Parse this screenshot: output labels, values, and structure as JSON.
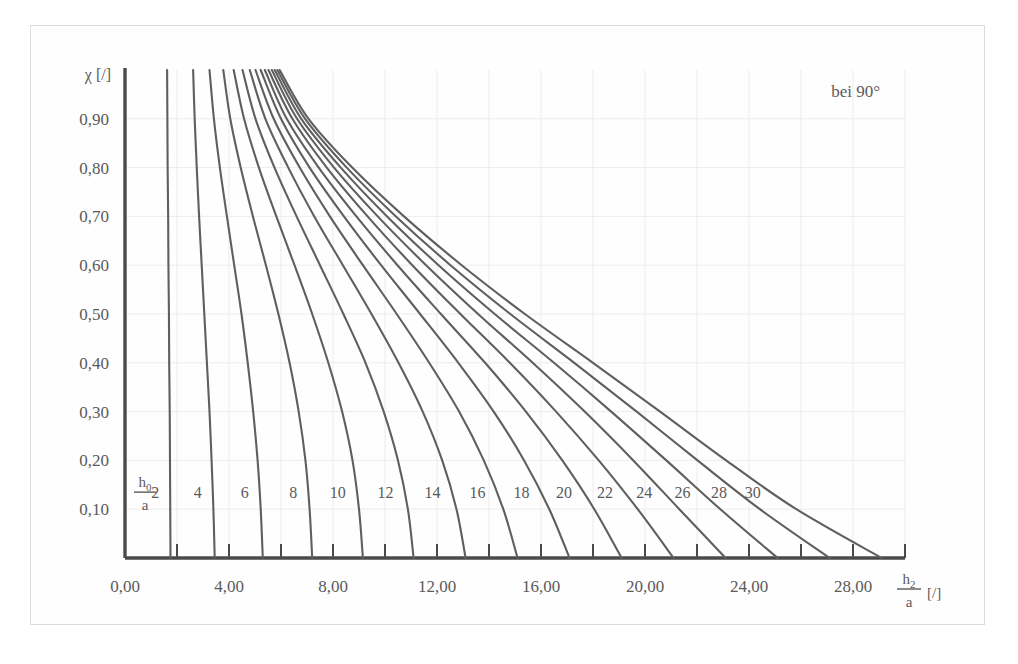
{
  "chart_data": {
    "type": "line",
    "title": "",
    "annotation": "bei 90°",
    "xlabel_main": "h",
    "xlabel_sub": "2",
    "xlabel_den": "a",
    "xlabel_unit": "[/]",
    "ylabel": "χ [/]",
    "curve_family_label_num": "h",
    "curve_family_label_sub": "0",
    "curve_family_label_den": "a",
    "xlim": [
      0,
      30
    ],
    "ylim": [
      0,
      1.0
    ],
    "grid": true,
    "x_tick_labels": [
      "0,00",
      "4,00",
      "8,00",
      "12,00",
      "16,00",
      "20,00",
      "24,00",
      "28,00"
    ],
    "x_tick_values": [
      0,
      4,
      8,
      12,
      16,
      20,
      24,
      28
    ],
    "x_minor_tick_values": [
      2,
      6,
      10,
      14,
      18,
      22,
      26,
      30
    ],
    "y_tick_labels": [
      "0,10",
      "0,20",
      "0,30",
      "0,40",
      "0,50",
      "0,60",
      "0,70",
      "0,80",
      "0,90"
    ],
    "y_tick_values": [
      0.1,
      0.2,
      0.3,
      0.4,
      0.5,
      0.6,
      0.7,
      0.8,
      0.9
    ],
    "series": [
      {
        "name": "2",
        "label": "2",
        "x_intercept": 1.75,
        "points": [
          [
            1.62,
            1.0
          ],
          [
            1.63,
            0.9
          ],
          [
            1.64,
            0.8
          ],
          [
            1.66,
            0.7
          ],
          [
            1.67,
            0.6
          ],
          [
            1.69,
            0.5
          ],
          [
            1.7,
            0.4
          ],
          [
            1.72,
            0.3
          ],
          [
            1.73,
            0.2
          ],
          [
            1.74,
            0.1
          ],
          [
            1.75,
            0.0
          ]
        ]
      },
      {
        "name": "4",
        "label": "4",
        "x_intercept": 3.45,
        "points": [
          [
            2.62,
            1.0
          ],
          [
            2.68,
            0.9
          ],
          [
            2.76,
            0.8
          ],
          [
            2.85,
            0.7
          ],
          [
            2.95,
            0.6
          ],
          [
            3.05,
            0.5
          ],
          [
            3.15,
            0.4
          ],
          [
            3.25,
            0.3
          ],
          [
            3.33,
            0.2
          ],
          [
            3.4,
            0.1
          ],
          [
            3.45,
            0.0
          ]
        ]
      },
      {
        "name": "6",
        "label": "6",
        "x_intercept": 5.3,
        "points": [
          [
            3.25,
            1.0
          ],
          [
            3.42,
            0.9
          ],
          [
            3.65,
            0.8
          ],
          [
            3.92,
            0.7
          ],
          [
            4.2,
            0.6
          ],
          [
            4.48,
            0.5
          ],
          [
            4.72,
            0.4
          ],
          [
            4.93,
            0.3
          ],
          [
            5.1,
            0.2
          ],
          [
            5.22,
            0.1
          ],
          [
            5.3,
            0.0
          ]
        ]
      },
      {
        "name": "8",
        "label": "8",
        "x_intercept": 7.2,
        "points": [
          [
            3.78,
            1.0
          ],
          [
            4.05,
            0.9
          ],
          [
            4.45,
            0.8
          ],
          [
            4.92,
            0.7
          ],
          [
            5.42,
            0.6
          ],
          [
            5.9,
            0.5
          ],
          [
            6.33,
            0.4
          ],
          [
            6.68,
            0.3
          ],
          [
            6.94,
            0.2
          ],
          [
            7.1,
            0.1
          ],
          [
            7.2,
            0.0
          ]
        ]
      },
      {
        "name": "10",
        "label": "10",
        "x_intercept": 9.15,
        "points": [
          [
            4.18,
            1.0
          ],
          [
            4.58,
            0.9
          ],
          [
            5.15,
            0.8
          ],
          [
            5.82,
            0.7
          ],
          [
            6.52,
            0.6
          ],
          [
            7.2,
            0.5
          ],
          [
            7.82,
            0.4
          ],
          [
            8.35,
            0.3
          ],
          [
            8.75,
            0.2
          ],
          [
            9.0,
            0.1
          ],
          [
            9.15,
            0.0
          ]
        ]
      },
      {
        "name": "12",
        "label": "12",
        "x_intercept": 11.1,
        "points": [
          [
            4.52,
            1.0
          ],
          [
            5.02,
            0.9
          ],
          [
            5.75,
            0.8
          ],
          [
            6.6,
            0.7
          ],
          [
            7.5,
            0.6
          ],
          [
            8.4,
            0.5
          ],
          [
            9.25,
            0.4
          ],
          [
            9.95,
            0.3
          ],
          [
            10.5,
            0.2
          ],
          [
            10.88,
            0.1
          ],
          [
            11.1,
            0.0
          ]
        ]
      },
      {
        "name": "14",
        "label": "14",
        "x_intercept": 13.1,
        "points": [
          [
            4.8,
            1.0
          ],
          [
            5.4,
            0.9
          ],
          [
            6.28,
            0.8
          ],
          [
            7.28,
            0.7
          ],
          [
            8.38,
            0.6
          ],
          [
            9.48,
            0.5
          ],
          [
            10.52,
            0.4
          ],
          [
            11.45,
            0.3
          ],
          [
            12.2,
            0.2
          ],
          [
            12.75,
            0.1
          ],
          [
            13.1,
            0.0
          ]
        ]
      },
      {
        "name": "16",
        "label": "16",
        "x_intercept": 15.1,
        "points": [
          [
            5.02,
            1.0
          ],
          [
            5.72,
            0.9
          ],
          [
            6.72,
            0.8
          ],
          [
            7.88,
            0.7
          ],
          [
            9.15,
            0.6
          ],
          [
            10.45,
            0.5
          ],
          [
            11.7,
            0.4
          ],
          [
            12.85,
            0.3
          ],
          [
            13.8,
            0.2
          ],
          [
            14.55,
            0.1
          ],
          [
            15.1,
            0.0
          ]
        ]
      },
      {
        "name": "18",
        "label": "18",
        "x_intercept": 17.1,
        "points": [
          [
            5.22,
            1.0
          ],
          [
            6.0,
            0.9
          ],
          [
            7.1,
            0.8
          ],
          [
            8.42,
            0.7
          ],
          [
            9.85,
            0.6
          ],
          [
            11.35,
            0.5
          ],
          [
            12.82,
            0.4
          ],
          [
            14.18,
            0.3
          ],
          [
            15.35,
            0.2
          ],
          [
            16.32,
            0.1
          ],
          [
            17.1,
            0.0
          ]
        ]
      },
      {
        "name": "20",
        "label": "20",
        "x_intercept": 19.1,
        "points": [
          [
            5.38,
            1.0
          ],
          [
            6.22,
            0.9
          ],
          [
            7.45,
            0.8
          ],
          [
            8.9,
            0.7
          ],
          [
            10.48,
            0.6
          ],
          [
            12.15,
            0.5
          ],
          [
            13.85,
            0.4
          ],
          [
            15.42,
            0.3
          ],
          [
            16.82,
            0.2
          ],
          [
            18.05,
            0.1
          ],
          [
            19.1,
            0.0
          ]
        ]
      },
      {
        "name": "22",
        "label": "22",
        "x_intercept": 21.1,
        "points": [
          [
            5.52,
            1.0
          ],
          [
            6.44,
            0.9
          ],
          [
            7.76,
            0.8
          ],
          [
            9.33,
            0.7
          ],
          [
            11.05,
            0.6
          ],
          [
            12.9,
            0.5
          ],
          [
            14.8,
            0.4
          ],
          [
            16.58,
            0.3
          ],
          [
            18.22,
            0.2
          ],
          [
            19.72,
            0.1
          ],
          [
            21.1,
            0.0
          ]
        ]
      },
      {
        "name": "24",
        "label": "24",
        "x_intercept": 23.1,
        "points": [
          [
            5.65,
            1.0
          ],
          [
            6.62,
            0.9
          ],
          [
            8.04,
            0.8
          ],
          [
            9.72,
            0.7
          ],
          [
            11.58,
            0.6
          ],
          [
            13.58,
            0.5
          ],
          [
            15.68,
            0.4
          ],
          [
            17.68,
            0.3
          ],
          [
            19.55,
            0.2
          ],
          [
            21.32,
            0.1
          ],
          [
            23.1,
            0.0
          ]
        ]
      },
      {
        "name": "26",
        "label": "26",
        "x_intercept": 25.1,
        "points": [
          [
            5.76,
            1.0
          ],
          [
            6.78,
            0.9
          ],
          [
            8.3,
            0.8
          ],
          [
            10.08,
            0.7
          ],
          [
            12.06,
            0.6
          ],
          [
            14.22,
            0.5
          ],
          [
            16.5,
            0.4
          ],
          [
            18.7,
            0.3
          ],
          [
            20.82,
            0.2
          ],
          [
            22.9,
            0.1
          ],
          [
            25.1,
            0.0
          ]
        ]
      },
      {
        "name": "28",
        "label": "28",
        "x_intercept": 27.1,
        "points": [
          [
            5.86,
            1.0
          ],
          [
            6.93,
            0.9
          ],
          [
            8.53,
            0.8
          ],
          [
            10.42,
            0.7
          ],
          [
            12.52,
            0.6
          ],
          [
            14.82,
            0.5
          ],
          [
            17.28,
            0.4
          ],
          [
            19.68,
            0.3
          ],
          [
            22.02,
            0.2
          ],
          [
            24.42,
            0.1
          ],
          [
            27.1,
            0.0
          ]
        ]
      },
      {
        "name": "30",
        "label": "30",
        "x_intercept": 29.1,
        "points": [
          [
            5.95,
            1.0
          ],
          [
            7.06,
            0.9
          ],
          [
            8.74,
            0.8
          ],
          [
            10.73,
            0.7
          ],
          [
            12.95,
            0.6
          ],
          [
            15.38,
            0.5
          ],
          [
            18.0,
            0.4
          ],
          [
            20.58,
            0.3
          ],
          [
            23.12,
            0.2
          ],
          [
            25.82,
            0.1
          ],
          [
            29.1,
            0.0
          ]
        ]
      }
    ],
    "curve_label_y": 0.135,
    "colors": {
      "curve": "#5f5f5f",
      "axis": "#4a4a4a",
      "grid": "#ececec",
      "text": "#5a5a5a",
      "frame": "#dcdcdc",
      "background": "#ffffff"
    }
  }
}
